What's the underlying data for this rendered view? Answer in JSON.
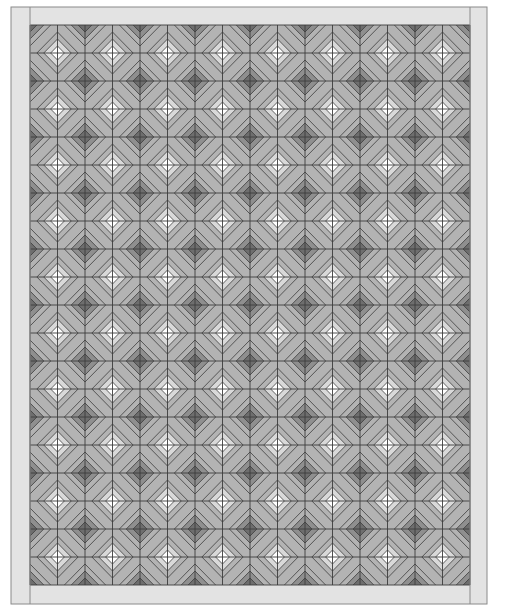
{
  "canvas": {
    "width": 505,
    "height": 616
  },
  "quilt": {
    "outer": {
      "x": 11,
      "y": 7,
      "right": 487,
      "bottom": 604
    },
    "field": {
      "x": 30,
      "y": 25,
      "right": 470,
      "bottom": 585
    },
    "grid": {
      "cols": 16,
      "rows": 20
    },
    "rings": [
      7,
      14
    ],
    "colors": {
      "border": "#e3e3e3",
      "line": "#3c3c3c",
      "background": "#b3b3b3",
      "light_core": "#ffffff",
      "light_ring": "#d9d9d9",
      "dark_core": "#6e6e6e",
      "dark_ring": "#8f8f8f"
    }
  }
}
